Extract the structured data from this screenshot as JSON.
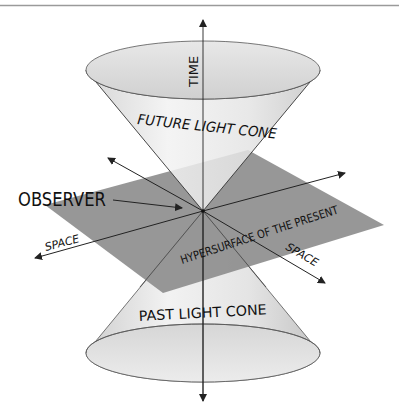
{
  "diagram": {
    "labels": {
      "time": "TIME",
      "future_cone": "FUTURE LIGHT CONE",
      "past_cone": "PAST LIGHT CONE",
      "observer": "OBSERVER",
      "space_left": "SPACE",
      "space_right": "SPACE",
      "hypersurface": "HYPERSURFACE OF THE PRESENT"
    },
    "colors": {
      "background": "#ffffff",
      "plane": "#8e8e8e",
      "cone_light": "#e6e6e6",
      "cone_rim": "#d2d2d2",
      "line": "#222222",
      "top_rule": "#9a9a9a"
    },
    "elements": [
      {
        "name": "future-light-cone",
        "type": "cone",
        "apex": [
          203,
          211
        ],
        "base_center": [
          203,
          70
        ],
        "rx": 117,
        "ry": 29
      },
      {
        "name": "past-light-cone",
        "type": "cone",
        "apex": [
          203,
          211
        ],
        "base_center": [
          203,
          353
        ],
        "rx": 117,
        "ry": 29
      },
      {
        "name": "hypersurface-plane",
        "type": "parallelogram",
        "corners": [
          [
            248,
            150
          ],
          [
            384,
            225
          ],
          [
            163,
            293
          ],
          [
            45,
            205
          ]
        ]
      },
      {
        "name": "time-axis",
        "type": "arrow",
        "from": [
          203,
          401
        ],
        "to": [
          203,
          20
        ]
      },
      {
        "name": "space-axis-1",
        "type": "arrow",
        "from": [
          35,
          258
        ],
        "to": [
          345,
          173
        ]
      },
      {
        "name": "space-axis-2",
        "type": "arrow",
        "from": [
          108,
          158
        ],
        "to": [
          325,
          283
        ]
      },
      {
        "name": "observer-pointer",
        "type": "arrow",
        "from": [
          113,
          200
        ],
        "to": [
          182,
          208
        ]
      }
    ]
  }
}
